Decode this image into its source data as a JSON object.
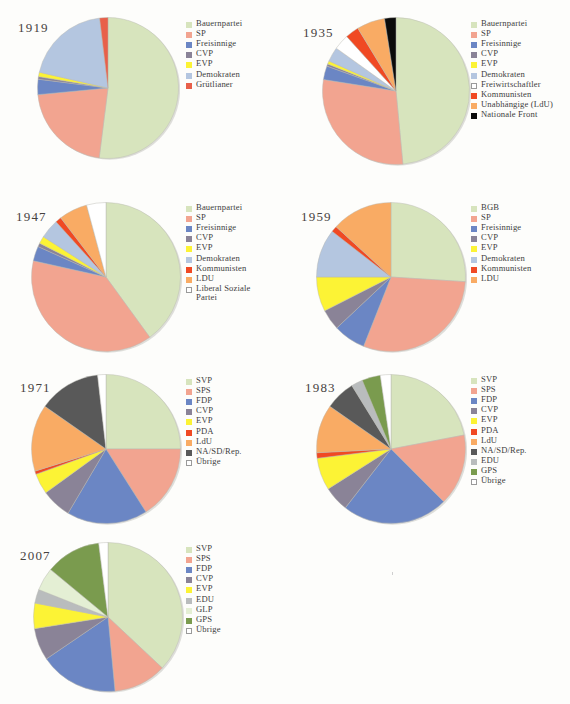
{
  "page": {
    "background": "#fdfdfb",
    "swatch_outline_color": "#9a9a9a"
  },
  "palette": {
    "bauernpartei_svp_bgb": "#d7e4bd",
    "sp_sps": "#f2a490",
    "freisinnige_fdp": "#6b86c4",
    "cvp": "#8a8397",
    "evp": "#fcf335",
    "demokraten_edu": "#b4c6e0",
    "gruetlianer": "#e8604a",
    "freiwirtschaftler": "#ffffff",
    "kommunisten_pda": "#f04923",
    "ldu_unabhaengige": "#f9ab64",
    "nationale_front": "#0a0a0a",
    "na_sd_rep": "#595959",
    "gps": "#7a9b4e",
    "glp": "#e4efd4",
    "uebrige": "#ffffff"
  },
  "charts": [
    {
      "id": "chart-1919",
      "year": "1919",
      "chart_data": {
        "type": "pie",
        "title": "1919",
        "labels": [
          "Bauernpartei",
          "SP",
          "Freisinnige",
          "CVP",
          "EVP",
          "Demokraten",
          "Grütlianer"
        ],
        "values": [
          52.0,
          21.5,
          3.5,
          0.6,
          1.0,
          19.5,
          1.9
        ],
        "colors": [
          "#d7e4bd",
          "#f2a490",
          "#6b86c4",
          "#8a8397",
          "#fcf335",
          "#b4c6e0",
          "#e8604a"
        ],
        "legend_position": "right",
        "start_angle": 0
      }
    },
    {
      "id": "chart-1935",
      "year": "1935",
      "chart_data": {
        "type": "pie",
        "title": "1935",
        "labels": [
          "Bauernpartei",
          "SP",
          "Freisinnige",
          "CVP",
          "EVP",
          "Demokraten",
          "Freiwirtschaftler",
          "Kommunisten",
          "Unabhängige (LdU)",
          "Nationale Front"
        ],
        "values": [
          48.5,
          29.0,
          3.0,
          0.5,
          0.7,
          3.2,
          3.4,
          3.0,
          6.2,
          2.5
        ],
        "colors": [
          "#d7e4bd",
          "#f2a490",
          "#6b86c4",
          "#8a8397",
          "#fcf335",
          "#b4c6e0",
          "#ffffff",
          "#f04923",
          "#f9ab64",
          "#0a0a0a"
        ],
        "legend_position": "right",
        "start_angle": 0
      }
    },
    {
      "id": "chart-1947",
      "year": "1947",
      "chart_data": {
        "type": "pie",
        "title": "1947",
        "labels": [
          "Bauernpartei",
          "SP",
          "Freisinnige",
          "CVP",
          "EVP",
          "Demokraten",
          "Kommunisten",
          "LDU",
          "Liberal Soziale\nPartei"
        ],
        "values": [
          40.0,
          38.5,
          3.2,
          0.8,
          1.6,
          4.2,
          1.3,
          6.2,
          4.2
        ],
        "colors": [
          "#d7e4bd",
          "#f2a490",
          "#6b86c4",
          "#8a8397",
          "#fcf335",
          "#b4c6e0",
          "#f04923",
          "#f9ab64",
          "#ffffff"
        ],
        "legend_position": "right",
        "start_angle": 0
      }
    },
    {
      "id": "chart-1959",
      "year": "1959",
      "chart_data": {
        "type": "pie",
        "title": "1959",
        "labels": [
          "BGB",
          "SP",
          "Freisinnige",
          "CVP",
          "EVP",
          "Demokraten",
          "Kommunisten",
          "LDU"
        ],
        "values": [
          26.0,
          30.0,
          7.0,
          4.5,
          7.5,
          10.5,
          1.3,
          13.2
        ],
        "colors": [
          "#d7e4bd",
          "#f2a490",
          "#6b86c4",
          "#8a8397",
          "#fcf335",
          "#b4c6e0",
          "#f04923",
          "#f9ab64"
        ],
        "legend_position": "right",
        "start_angle": 0
      }
    },
    {
      "id": "chart-1971",
      "year": "1971",
      "chart_data": {
        "type": "pie",
        "title": "1971",
        "labels": [
          "SVP",
          "SPS",
          "FDP",
          "CVP",
          "EVP",
          "PDA",
          "LdU",
          "NA/SD/Rep.",
          "Übrige"
        ],
        "values": [
          25.0,
          16.0,
          17.5,
          6.5,
          4.5,
          0.7,
          14.5,
          13.5,
          1.8
        ],
        "colors": [
          "#d7e4bd",
          "#f2a490",
          "#6b86c4",
          "#8a8397",
          "#fcf335",
          "#f04923",
          "#f9ab64",
          "#595959",
          "#ffffff"
        ],
        "legend_position": "right",
        "start_angle": 0
      }
    },
    {
      "id": "chart-1983",
      "year": "1983",
      "chart_data": {
        "type": "pie",
        "title": "1983",
        "labels": [
          "SVP",
          "SPS",
          "FDP",
          "CVP",
          "EVP",
          "PDA",
          "LdU",
          "NA/SD/Rep.",
          "EDU",
          "GPS",
          "Übrige"
        ],
        "values": [
          22.0,
          15.5,
          23.0,
          5.5,
          7.0,
          1.2,
          10.5,
          6.5,
          2.5,
          4.0,
          2.3
        ],
        "colors": [
          "#d7e4bd",
          "#f2a490",
          "#6b86c4",
          "#8a8397",
          "#fcf335",
          "#f04923",
          "#f9ab64",
          "#595959",
          "#b9bcbd",
          "#7a9b4e",
          "#ffffff"
        ],
        "legend_position": "right",
        "start_angle": 0
      }
    },
    {
      "id": "chart-2007",
      "year": "2007",
      "chart_data": {
        "type": "pie",
        "title": "2007",
        "labels": [
          "SVP",
          "SPS",
          "FDP",
          "CVP",
          "EVP",
          "EDU",
          "GLP",
          "GPS",
          "Übrige"
        ],
        "values": [
          37.0,
          11.5,
          17.0,
          7.0,
          5.5,
          3.0,
          5.0,
          12.0,
          2.0
        ],
        "colors": [
          "#d7e4bd",
          "#f2a490",
          "#6b86c4",
          "#8a8397",
          "#fcf335",
          "#b9bcbd",
          "#e4efd4",
          "#7a9b4e",
          "#ffffff"
        ],
        "legend_position": "right",
        "start_angle": 0
      }
    }
  ]
}
